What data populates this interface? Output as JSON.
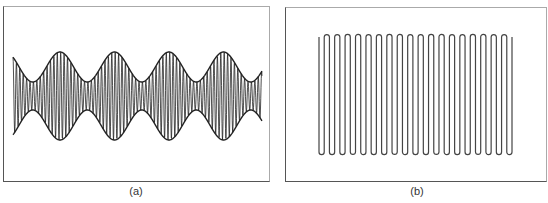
{
  "figure": {
    "panels": [
      {
        "id": "a",
        "caption": "(a)",
        "description": "Amplitude-modulated waveform (beat pattern)",
        "waveform": {
          "x_start": 12,
          "x_end": 261,
          "center_y": 95,
          "max_amplitude": 44,
          "min_amplitude": 14,
          "envelope_peaks_x": [
            59,
            114,
            169,
            222
          ],
          "envelope_period": 54.5,
          "carrier_cycles_per_envelope_period": 16,
          "stroke_color": "#222222"
        }
      },
      {
        "id": "b",
        "caption": "(b)",
        "description": "Serpentine (meander) line pattern",
        "serpentine": {
          "x_start": 318,
          "x_end": 511,
          "top_y": 36,
          "bottom_y": 151,
          "vertical_line_count": 38,
          "stroke_color": "#444444"
        }
      }
    ]
  }
}
